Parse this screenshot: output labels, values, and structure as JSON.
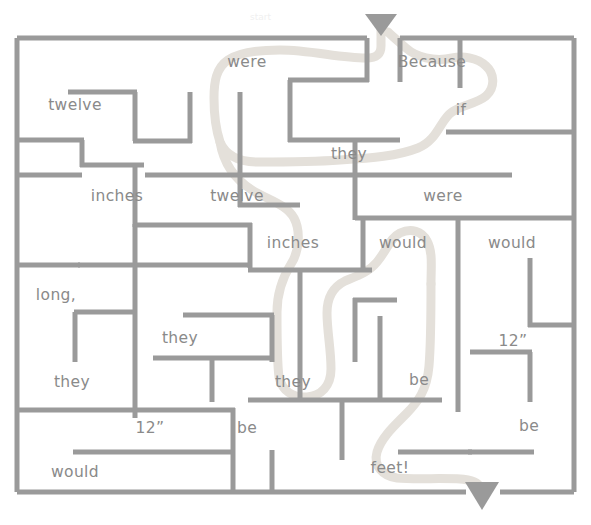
{
  "puzzle": {
    "type": "word-maze",
    "title_mark": "start",
    "solution_sentence": "Because if they were twelve inches they would be feet!",
    "colors": {
      "wall": "#9a9a9a",
      "border": "#9a9a9a",
      "word_text": "#8a8a8a",
      "solution_path": "#e2ded7",
      "arrow": "#9a9a9a",
      "background": "#ffffff"
    },
    "entry_arrow": {
      "name": "entry-arrow-down",
      "x": 379,
      "y": 14
    },
    "exit_arrow": {
      "name": "exit-arrow-down",
      "x": 481,
      "y": 482
    }
  },
  "words": [
    {
      "id": "w01",
      "text": "were",
      "x": 247,
      "y": 62,
      "on_path": true
    },
    {
      "id": "w02",
      "text": "Because",
      "x": 432,
      "y": 62,
      "on_path": true
    },
    {
      "id": "w03",
      "text": "twelve",
      "x": 75,
      "y": 105,
      "on_path": false
    },
    {
      "id": "w04",
      "text": "if",
      "x": 461,
      "y": 110,
      "on_path": true
    },
    {
      "id": "w05",
      "text": "they",
      "x": 349,
      "y": 154,
      "on_path": true
    },
    {
      "id": "w06",
      "text": "inches",
      "x": 117,
      "y": 196,
      "on_path": false
    },
    {
      "id": "w07",
      "text": "twelve",
      "x": 237,
      "y": 196,
      "on_path": true
    },
    {
      "id": "w08",
      "text": "were",
      "x": 443,
      "y": 196,
      "on_path": false
    },
    {
      "id": "w09",
      "text": "inches",
      "x": 293,
      "y": 243,
      "on_path": true
    },
    {
      "id": "w10",
      "text": "would",
      "x": 403,
      "y": 243,
      "on_path": true
    },
    {
      "id": "w11",
      "text": "would",
      "x": 512,
      "y": 243,
      "on_path": false
    },
    {
      "id": "w12",
      "text": "long,",
      "x": 56,
      "y": 295,
      "on_path": false
    },
    {
      "id": "w13",
      "text": "they",
      "x": 180,
      "y": 338,
      "on_path": false
    },
    {
      "id": "w14",
      "text": "12”",
      "x": 513,
      "y": 341,
      "on_path": false
    },
    {
      "id": "w15",
      "text": "they",
      "x": 72,
      "y": 382,
      "on_path": false
    },
    {
      "id": "w16",
      "text": "they",
      "x": 293,
      "y": 382,
      "on_path": true
    },
    {
      "id": "w17",
      "text": "be",
      "x": 419,
      "y": 380,
      "on_path": true
    },
    {
      "id": "w18",
      "text": "12”",
      "x": 150,
      "y": 428,
      "on_path": false
    },
    {
      "id": "w19",
      "text": "be",
      "x": 247,
      "y": 428,
      "on_path": false
    },
    {
      "id": "w20",
      "text": "be",
      "x": 529,
      "y": 426,
      "on_path": false
    },
    {
      "id": "w21",
      "text": "would",
      "x": 75,
      "y": 472,
      "on_path": false
    },
    {
      "id": "w22",
      "text": "feet!",
      "x": 390,
      "y": 468,
      "on_path": true
    }
  ],
  "walls": {
    "border": [
      {
        "id": "b-top-left",
        "x1": 17,
        "y1": 38,
        "x2": 367,
        "y2": 38
      },
      {
        "id": "b-top-right",
        "x1": 398,
        "y1": 38,
        "x2": 574,
        "y2": 38
      },
      {
        "id": "b-left",
        "x1": 17,
        "y1": 38,
        "x2": 17,
        "y2": 492
      },
      {
        "id": "b-right",
        "x1": 574,
        "y1": 38,
        "x2": 574,
        "y2": 492
      },
      {
        "id": "b-bottom-left",
        "x1": 17,
        "y1": 492,
        "x2": 467,
        "y2": 492
      },
      {
        "id": "b-bottom-right",
        "x1": 497,
        "y1": 492,
        "x2": 574,
        "y2": 492
      }
    ],
    "interior": [
      {
        "id": "h01",
        "x1": 367,
        "y1": 38,
        "x2": 367,
        "y2": 80
      },
      {
        "id": "h02",
        "x1": 290,
        "y1": 80,
        "x2": 367,
        "y2": 80
      },
      {
        "id": "h03",
        "x1": 290,
        "y1": 80,
        "x2": 290,
        "y2": 140
      },
      {
        "id": "h04",
        "x1": 290,
        "y1": 140,
        "x2": 400,
        "y2": 140
      },
      {
        "id": "h05",
        "x1": 400,
        "y1": 38,
        "x2": 400,
        "y2": 80
      },
      {
        "id": "h06",
        "x1": 446,
        "y1": 132,
        "x2": 574,
        "y2": 132
      },
      {
        "id": "h07",
        "x1": 17,
        "y1": 175,
        "x2": 130,
        "y2": 175
      },
      {
        "id": "h08",
        "x1": 145,
        "y1": 175,
        "x2": 510,
        "y2": 175
      },
      {
        "id": "h09",
        "x1": 70,
        "y1": 93,
        "x2": 135,
        "y2": 93
      },
      {
        "id": "h10",
        "x1": 135,
        "y1": 93,
        "x2": 135,
        "y2": 140
      },
      {
        "id": "h11",
        "x1": 135,
        "y1": 140,
        "x2": 190,
        "y2": 140
      },
      {
        "id": "h12",
        "x1": 190,
        "y1": 93,
        "x2": 190,
        "y2": 140
      },
      {
        "id": "h13",
        "x1": 17,
        "y1": 140,
        "x2": 82,
        "y2": 140
      },
      {
        "id": "h14",
        "x1": 82,
        "y1": 140,
        "x2": 82,
        "y2": 165
      },
      {
        "id": "h15",
        "x1": 82,
        "y1": 165,
        "x2": 143,
        "y2": 165
      },
      {
        "id": "h16",
        "x1": 240,
        "y1": 93,
        "x2": 240,
        "y2": 205
      },
      {
        "id": "h17",
        "x1": 240,
        "y1": 205,
        "x2": 298,
        "y2": 205
      },
      {
        "id": "h18",
        "x1": 355,
        "y1": 140,
        "x2": 355,
        "y2": 218
      },
      {
        "id": "h19",
        "x1": 135,
        "y1": 175,
        "x2": 135,
        "y2": 225
      },
      {
        "id": "h20",
        "x1": 135,
        "y1": 225,
        "x2": 250,
        "y2": 225
      },
      {
        "id": "h21",
        "x1": 250,
        "y1": 225,
        "x2": 250,
        "y2": 265
      },
      {
        "id": "h22",
        "x1": 17,
        "y1": 265,
        "x2": 250,
        "y2": 265
      },
      {
        "id": "h23",
        "x1": 363,
        "y1": 218,
        "x2": 574,
        "y2": 218
      },
      {
        "id": "h24",
        "x1": 363,
        "y1": 218,
        "x2": 363,
        "y2": 268
      },
      {
        "id": "h25",
        "x1": 458,
        "y1": 218,
        "x2": 458,
        "y2": 410
      },
      {
        "id": "h26",
        "x1": 530,
        "y1": 258,
        "x2": 530,
        "y2": 325
      },
      {
        "id": "h27",
        "x1": 530,
        "y1": 325,
        "x2": 574,
        "y2": 325
      },
      {
        "id": "h28",
        "x1": 470,
        "y1": 352,
        "x2": 530,
        "y2": 352
      },
      {
        "id": "h29",
        "x1": 530,
        "y1": 352,
        "x2": 530,
        "y2": 400
      },
      {
        "id": "h30",
        "x1": 135,
        "y1": 265,
        "x2": 135,
        "y2": 415
      },
      {
        "id": "h31",
        "x1": 75,
        "y1": 312,
        "x2": 135,
        "y2": 312
      },
      {
        "id": "h32",
        "x1": 75,
        "y1": 312,
        "x2": 75,
        "y2": 360
      },
      {
        "id": "h33",
        "x1": 185,
        "y1": 315,
        "x2": 272,
        "y2": 315
      },
      {
        "id": "h34",
        "x1": 272,
        "y1": 315,
        "x2": 272,
        "y2": 360
      },
      {
        "id": "h35",
        "x1": 155,
        "y1": 358,
        "x2": 272,
        "y2": 358
      },
      {
        "id": "h36",
        "x1": 212,
        "y1": 358,
        "x2": 212,
        "y2": 400
      },
      {
        "id": "h37",
        "x1": 17,
        "y1": 410,
        "x2": 155,
        "y2": 410
      },
      {
        "id": "h38",
        "x1": 135,
        "y1": 410,
        "x2": 233,
        "y2": 410
      },
      {
        "id": "h39",
        "x1": 250,
        "y1": 270,
        "x2": 370,
        "y2": 270
      },
      {
        "id": "h40",
        "x1": 300,
        "y1": 270,
        "x2": 300,
        "y2": 400
      },
      {
        "id": "h41",
        "x1": 355,
        "y1": 300,
        "x2": 355,
        "y2": 360
      },
      {
        "id": "h42",
        "x1": 355,
        "y1": 300,
        "x2": 395,
        "y2": 300
      },
      {
        "id": "h43",
        "x1": 380,
        "y1": 318,
        "x2": 380,
        "y2": 400
      },
      {
        "id": "h44",
        "x1": 250,
        "y1": 400,
        "x2": 440,
        "y2": 400
      },
      {
        "id": "h45",
        "x1": 342,
        "y1": 400,
        "x2": 342,
        "y2": 458
      },
      {
        "id": "h46",
        "x1": 75,
        "y1": 452,
        "x2": 233,
        "y2": 452
      },
      {
        "id": "h47",
        "x1": 233,
        "y1": 410,
        "x2": 233,
        "y2": 492
      },
      {
        "id": "h48",
        "x1": 272,
        "y1": 452,
        "x2": 272,
        "y2": 492
      },
      {
        "id": "h49",
        "x1": 400,
        "y1": 452,
        "x2": 470,
        "y2": 452
      },
      {
        "id": "h50",
        "x1": 470,
        "y1": 452,
        "x2": 530,
        "y2": 452
      },
      {
        "id": "h51",
        "x1": 398,
        "y1": 38,
        "x2": 398,
        "y2": 38
      },
      {
        "id": "h52",
        "x1": 460,
        "y1": 38,
        "x2": 460,
        "y2": 132
      },
      {
        "id": "h53",
        "x1": 17,
        "y1": 175,
        "x2": 17,
        "y2": 175
      }
    ]
  },
  "solution_path_d": "M 381 33 L 381 48 C 381 58 372 58 364 58 C 300 58 272 52 252 52 C 228 52 218 62 218 78 C 218 92 222 102 222 118 C 222 150 236 160 258 160 C 290 160 318 160 346 160 C 378 160 400 158 420 150 C 440 142 438 120 452 112 C 462 106 474 104 484 96 C 494 88 492 74 486 66 C 478 56 462 54 452 56 C 432 60 414 56 404 48 C 396 42 390 36 386 32",
  "solution_path_d2": "M 222 118 C 222 150 230 170 248 186 C 264 200 286 202 294 218 C 300 230 298 250 290 262 C 282 274 276 290 276 310 C 276 340 276 360 278 375 C 280 388 292 394 306 394 C 320 394 330 384 330 368 C 330 348 326 330 326 312 C 326 294 334 284 344 280 C 356 276 368 272 376 262 C 386 250 388 238 398 232 C 408 226 420 228 426 238 C 432 248 430 264 430 282 C 430 310 430 340 428 364 C 426 388 418 400 406 412 C 394 424 382 436 378 450 C 374 464 382 474 396 476 C 416 478 450 476 466 478 C 478 480 482 486 482 492"
}
